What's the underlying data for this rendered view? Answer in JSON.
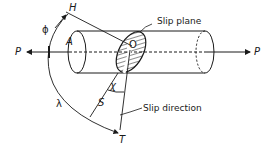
{
  "diagram": {
    "labels": {
      "load_left": "P",
      "load_right": "P",
      "cross_section": "A",
      "origin": "O",
      "normal_end": "H",
      "slip_dir_end": "T",
      "slip_dir_point": "S",
      "phi": "ϕ",
      "lambda": "λ",
      "chi": "χ",
      "slip_plane": "Slip plane",
      "slip_direction": "Slip direction"
    },
    "colors": {
      "line": "#1a1a1a",
      "background": "#ffffff"
    }
  }
}
